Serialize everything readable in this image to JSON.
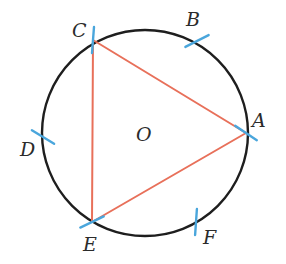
{
  "figure": {
    "colors": {
      "circle": "#1e1e1e",
      "triangle": "#e8705a",
      "arc_marks": "#4aa6dc",
      "labels": "#2b2b2b",
      "background": "#ffffff"
    },
    "circle": {
      "cx": 145,
      "cy": 133,
      "r": 103
    },
    "center_label": {
      "text": "O",
      "x": 136,
      "y": 141
    },
    "points": [
      {
        "name": "A",
        "label": "A",
        "x": 246,
        "y": 133,
        "label_x": 252,
        "label_y": 127
      },
      {
        "name": "B",
        "label": "B",
        "x": 197,
        "y": 41,
        "label_x": 186,
        "label_y": 26
      },
      {
        "name": "C",
        "label": "C",
        "x": 93,
        "y": 40,
        "label_x": 72,
        "label_y": 37
      },
      {
        "name": "D",
        "label": "D",
        "x": 43,
        "y": 137,
        "label_x": 20,
        "label_y": 156
      },
      {
        "name": "E",
        "label": "E",
        "x": 92,
        "y": 222,
        "label_x": 83,
        "label_y": 251
      },
      {
        "name": "F",
        "label": "F",
        "x": 196,
        "y": 222,
        "label_x": 203,
        "label_y": 244
      }
    ],
    "triangle": [
      "A",
      "C",
      "E"
    ]
  }
}
